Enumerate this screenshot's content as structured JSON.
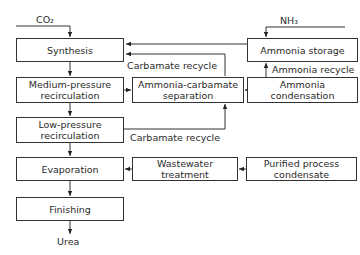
{
  "diagram": {
    "type": "process-flow",
    "inputs": {
      "co2": "CO₂",
      "nh3": "NH₃"
    },
    "output": "Urea",
    "nodes": {
      "synthesis": "Synthesis",
      "medium_pressure": "Medium-pressure recirculation",
      "low_pressure": "Low-pressure recirculation",
      "evaporation": "Evaporation",
      "finishing": "Finishing",
      "ammonia_carbamate_sep": "Ammonia-carbamate separation",
      "ammonia_storage": "Ammonia storage",
      "ammonia_condensation": "Ammonia condensation",
      "wastewater": "Wastewater treatment",
      "purified_condensate": "Purified process condensate"
    },
    "edge_labels": {
      "carbamate_recycle_top": "Carbamate recycle",
      "ammonia_recycle": "Ammonia recycle",
      "carbamate_recycle_bottom": "Carbamate recycle"
    },
    "edges": [
      {
        "from": "CO₂",
        "to": "Synthesis"
      },
      {
        "from": "NH₃",
        "to": "Ammonia storage"
      },
      {
        "from": "Ammonia storage",
        "to": "Synthesis"
      },
      {
        "from": "Ammonia-carbamate separation",
        "to": "Synthesis",
        "label": "Carbamate recycle"
      },
      {
        "from": "Synthesis",
        "to": "Medium-pressure recirculation"
      },
      {
        "from": "Medium-pressure recirculation",
        "to": "Ammonia-carbamate separation"
      },
      {
        "from": "Ammonia condensation",
        "to": "Ammonia-carbamate separation"
      },
      {
        "from": "Ammonia condensation",
        "to": "Ammonia storage",
        "label": "Ammonia recycle"
      },
      {
        "from": "Medium-pressure recirculation",
        "to": "Low-pressure recirculation"
      },
      {
        "from": "Low-pressure recirculation",
        "to": "Ammonia-carbamate separation",
        "label": "Carbamate recycle"
      },
      {
        "from": "Low-pressure recirculation",
        "to": "Evaporation"
      },
      {
        "from": "Wastewater treatment",
        "to": "Evaporation"
      },
      {
        "from": "Purified process condensate",
        "to": "Wastewater treatment"
      },
      {
        "from": "Evaporation",
        "to": "Finishing"
      },
      {
        "from": "Finishing",
        "to": "Urea"
      }
    ]
  }
}
